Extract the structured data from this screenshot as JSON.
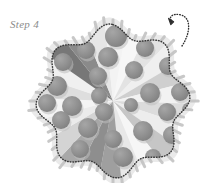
{
  "figure": {
    "title_label": "Step 4",
    "caption_color": "#8b8b8b",
    "background_color": "#ffffff",
    "diagram_type": "cell-cross-section",
    "membrane": {
      "name": "dotted-membrane-outline",
      "style": "dotted",
      "stroke_color": "#3a3a3a",
      "fill_color": "#f4f4f4",
      "lobes": 8,
      "center": [
        113,
        101
      ],
      "outer_radius": 77,
      "inner_radius": 64
    },
    "halo": {
      "name": "membrane-halo",
      "fill_color": "#d8d8d8",
      "opacity": 0.55
    },
    "spikes": {
      "name": "surface-spike-proteins",
      "count": 56,
      "color": "#c3c3c3",
      "length": 7,
      "width": 3
    },
    "wedges": {
      "name": "radiating-wedges",
      "center": [
        113,
        101
      ],
      "count": 22,
      "radius": 68,
      "grays": [
        "#f7f7f7",
        "#e3e3e3",
        "#efefef",
        "#cfcfcf",
        "#f2f2f2",
        "#dcdcdc",
        "#ededed",
        "#c6c6c6",
        "#f6f6f6",
        "#e8e8e8",
        "#9f9f9f",
        "#8e8e8e",
        "#a8a8a8",
        "#d4d4d4",
        "#ebebeb",
        "#f4f4f4",
        "#dedede",
        "#f0f0f0",
        "#777777",
        "#8a8a8a",
        "#e6e6e6",
        "#f3f3f3"
      ]
    },
    "particles": {
      "name": "granule-spheres",
      "color": "#8e8e8e",
      "shadow_color": "#bdbdbd",
      "count": 26,
      "radius_range": [
        7,
        11
      ],
      "positions": [
        [
          116,
          36,
          11
        ],
        [
          86,
          50,
          9
        ],
        [
          145,
          48,
          9
        ],
        [
          63,
          62,
          9
        ],
        [
          108,
          57,
          10
        ],
        [
          168,
          66,
          9
        ],
        [
          134,
          70,
          9
        ],
        [
          98,
          76,
          9
        ],
        [
          180,
          92,
          9
        ],
        [
          57,
          86,
          10
        ],
        [
          150,
          93,
          10
        ],
        [
          72,
          106,
          10
        ],
        [
          167,
          112,
          9
        ],
        [
          104,
          112,
          9
        ],
        [
          131,
          105,
          7
        ],
        [
          61,
          120,
          9
        ],
        [
          88,
          128,
          10
        ],
        [
          143,
          131,
          10
        ],
        [
          113,
          139,
          9
        ],
        [
          172,
          135,
          9
        ],
        [
          80,
          149,
          9
        ],
        [
          123,
          157,
          10
        ],
        [
          153,
          157,
          8
        ],
        [
          47,
          103,
          9
        ],
        [
          190,
          110,
          8
        ],
        [
          99,
          96,
          8
        ]
      ]
    },
    "arrow": {
      "name": "curled-budding-arrow",
      "color": "#2e2e2e",
      "style": "dotted-curl-with-arrowhead",
      "start": [
        182,
        46
      ],
      "end": [
        172,
        14
      ]
    }
  }
}
